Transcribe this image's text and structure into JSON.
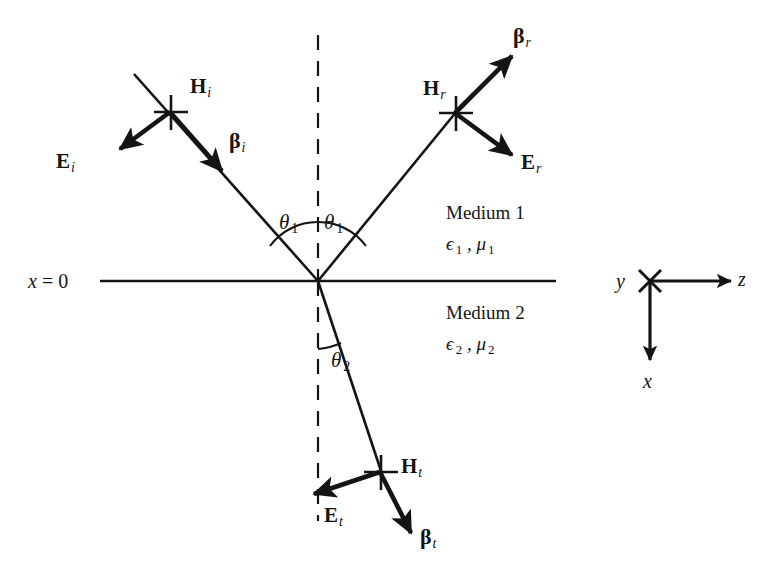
{
  "figure": {
    "colors": {
      "ink": "#141414",
      "background": "#ffffff"
    }
  },
  "boundary": {
    "plane_label_x": "x",
    "plane_label_eq": " = ",
    "plane_label_val": "0"
  },
  "incident_wave": {
    "h_symbol": "H",
    "h_subscript": "i",
    "e_symbol": "E",
    "e_subscript": "i",
    "beta_symbol": "β",
    "beta_subscript": "i"
  },
  "reflected_wave": {
    "h_symbol": "H",
    "h_subscript": "r",
    "e_symbol": "E",
    "e_subscript": "r",
    "beta_symbol": "β",
    "beta_subscript": "r"
  },
  "transmitted_wave": {
    "h_symbol": "H",
    "h_subscript": "t",
    "e_symbol": "E",
    "e_subscript": "t",
    "beta_symbol": "β",
    "beta_subscript": "t"
  },
  "angles": {
    "incidence": {
      "symbol": "θ",
      "subscript": "1"
    },
    "reflection": {
      "symbol": "θ",
      "subscript": "1"
    },
    "transmission": {
      "symbol": "θ",
      "subscript": "2"
    }
  },
  "media": {
    "upper": {
      "name": "Medium 1",
      "permittivity": "ϵ",
      "permittivity_sub": "1",
      "separator": " , ",
      "permeability": "μ",
      "permeability_sub": "1"
    },
    "lower": {
      "name": "Medium 2",
      "permittivity": "ϵ",
      "permittivity_sub": "2",
      "separator": " , ",
      "permeability": "μ",
      "permeability_sub": "2"
    }
  },
  "axes": {
    "y_label": "y",
    "z_label": "z",
    "x_label": "x",
    "y_icon": "cross-out-of-page-icon"
  }
}
